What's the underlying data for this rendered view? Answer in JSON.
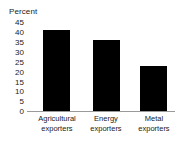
{
  "chart_data": {
    "type": "bar",
    "title": "",
    "subtitle": "",
    "xlabel": "",
    "ylabel": "Percent",
    "ylim": [
      0,
      45
    ],
    "yticks": [
      "0",
      "5",
      "10",
      "15",
      "20",
      "25",
      "30",
      "35",
      "40",
      "45"
    ],
    "ytick_values": [
      0,
      5,
      10,
      15,
      20,
      25,
      30,
      35,
      40,
      45
    ],
    "grid": false,
    "legend": false,
    "legend_position": "none",
    "categories": [
      "Agricultural exporters",
      "Energy exporters",
      "Metal exporters"
    ],
    "category_lines": [
      [
        "Agricultural",
        "exporters"
      ],
      [
        "Energy",
        "exporters"
      ],
      [
        "Metal",
        "exporters"
      ]
    ],
    "values": [
      41,
      36,
      23
    ],
    "series": [
      {
        "name": "",
        "values": [
          41,
          36,
          23
        ]
      }
    ],
    "bar_color": "#000000",
    "axis_color": "#9a9a9a",
    "background": "#ffffff"
  }
}
